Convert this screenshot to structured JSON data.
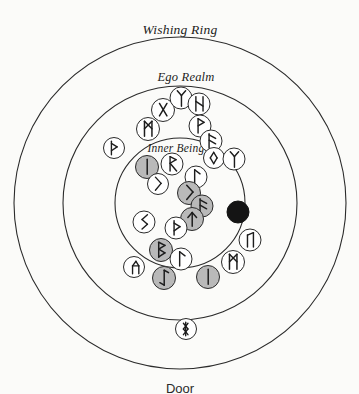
{
  "diagram": {
    "title_visible": false,
    "type": "rune-casting-circle-spread",
    "background_color": "#fbfbf9",
    "line_color": "#2b2b2b",
    "center": {
      "x": 180,
      "y": 203
    },
    "rings": [
      {
        "id": "wishing-ring",
        "label": "Wishing Ring",
        "radius": 166,
        "label_x": 180,
        "label_y": 30
      },
      {
        "id": "ego-realm",
        "label": "Ego Realm",
        "radius": 117,
        "label_x": 186,
        "label_y": 77
      },
      {
        "id": "inner-being",
        "label": "Inner Being",
        "radius": 65,
        "label_x": 176,
        "label_y": 148
      }
    ],
    "outside_label": {
      "text": "Door",
      "x": 180,
      "y": 381
    },
    "token_fills": {
      "white": "#ffffff",
      "gray": "#b9b9b9",
      "black": "#141414"
    },
    "tokens": [
      {
        "name": "gebo",
        "glyph": "X",
        "x": 163,
        "y": 110,
        "r": 12,
        "fill": "white",
        "zone": "ego-realm"
      },
      {
        "name": "elhaz",
        "glyph": "Y",
        "x": 181,
        "y": 98,
        "r": 11.5,
        "fill": "white",
        "zone": "ego-realm"
      },
      {
        "name": "hagalaz",
        "glyph": "N",
        "x": 199,
        "y": 104,
        "r": 11.5,
        "fill": "white",
        "zone": "ego-realm"
      },
      {
        "name": "wunjo",
        "glyph": "P",
        "x": 200,
        "y": 126,
        "r": 11.5,
        "fill": "white",
        "zone": "ego-realm"
      },
      {
        "name": "ansuz",
        "glyph": "F",
        "x": 211,
        "y": 141,
        "r": 11.5,
        "fill": "white",
        "zone": "ego-realm"
      },
      {
        "name": "ehwaz-left",
        "glyph": "M",
        "x": 148,
        "y": 129,
        "r": 12,
        "fill": "white",
        "zone": "ego-realm"
      },
      {
        "name": "thurisaz",
        "glyph": "TH",
        "x": 114,
        "y": 148,
        "r": 11,
        "fill": "white",
        "zone": "ego-realm"
      },
      {
        "name": "isa-gray",
        "glyph": "I",
        "x": 147,
        "y": 167,
        "r": 12,
        "fill": "gray",
        "zone": "inner-being"
      },
      {
        "name": "raido",
        "glyph": "R",
        "x": 172,
        "y": 164,
        "r": 11.5,
        "fill": "white",
        "zone": "inner-being"
      },
      {
        "name": "perthro",
        "glyph": "K",
        "x": 158,
        "y": 184,
        "r": 11,
        "fill": "white",
        "zone": "inner-being"
      },
      {
        "name": "laguz-mid",
        "glyph": "L",
        "x": 196,
        "y": 177,
        "r": 11.5,
        "fill": "white",
        "zone": "inner-being"
      },
      {
        "name": "ingwaz",
        "glyph": "NG",
        "x": 214,
        "y": 158,
        "r": 11,
        "fill": "white",
        "zone": "inner-being"
      },
      {
        "name": "algiz",
        "glyph": "Y",
        "x": 234,
        "y": 159,
        "r": 11.5,
        "fill": "white",
        "zone": "ego-realm"
      },
      {
        "name": "kenaz-gray",
        "glyph": "K",
        "x": 189,
        "y": 193,
        "r": 12,
        "fill": "gray",
        "zone": "inner-being"
      },
      {
        "name": "ansuz-gray",
        "glyph": "F",
        "x": 202,
        "y": 206,
        "r": 11.5,
        "fill": "gray",
        "zone": "inner-being"
      },
      {
        "name": "tiwaz-gray",
        "glyph": "T",
        "x": 192,
        "y": 219,
        "r": 12,
        "fill": "gray",
        "zone": "inner-being"
      },
      {
        "name": "thurisaz-mid",
        "glyph": "TH",
        "x": 176,
        "y": 228,
        "r": 11.5,
        "fill": "white",
        "zone": "inner-being"
      },
      {
        "name": "sowilo",
        "glyph": "S",
        "x": 144,
        "y": 222,
        "r": 11.5,
        "fill": "white",
        "zone": "inner-being"
      },
      {
        "name": "berkana-gray",
        "glyph": "B",
        "x": 161,
        "y": 250,
        "r": 12,
        "fill": "gray",
        "zone": "inner-being"
      },
      {
        "name": "laguz-low",
        "glyph": "L",
        "x": 181,
        "y": 259,
        "r": 11.5,
        "fill": "white",
        "zone": "inner-being"
      },
      {
        "name": "othala",
        "glyph": "O",
        "x": 134,
        "y": 267,
        "r": 11,
        "fill": "white",
        "zone": "ego-realm"
      },
      {
        "name": "eihwaz-gray",
        "glyph": "EI",
        "x": 164,
        "y": 278,
        "r": 12,
        "fill": "gray",
        "zone": "ego-realm"
      },
      {
        "name": "isa-low-gray",
        "glyph": "I",
        "x": 208,
        "y": 277,
        "r": 12,
        "fill": "gray",
        "zone": "ego-realm"
      },
      {
        "name": "ehwaz-right",
        "glyph": "M",
        "x": 233,
        "y": 262,
        "r": 12,
        "fill": "white",
        "zone": "ego-realm"
      },
      {
        "name": "uruz",
        "glyph": "U",
        "x": 250,
        "y": 240,
        "r": 11.5,
        "fill": "white",
        "zone": "ego-realm"
      },
      {
        "name": "blank-rune",
        "glyph": "",
        "x": 238,
        "y": 212,
        "r": 11.5,
        "fill": "black",
        "zone": "ego-realm"
      },
      {
        "name": "dagaz",
        "glyph": "D",
        "x": 186,
        "y": 329,
        "r": 11,
        "fill": "white",
        "zone": "wishing-ring"
      }
    ]
  }
}
